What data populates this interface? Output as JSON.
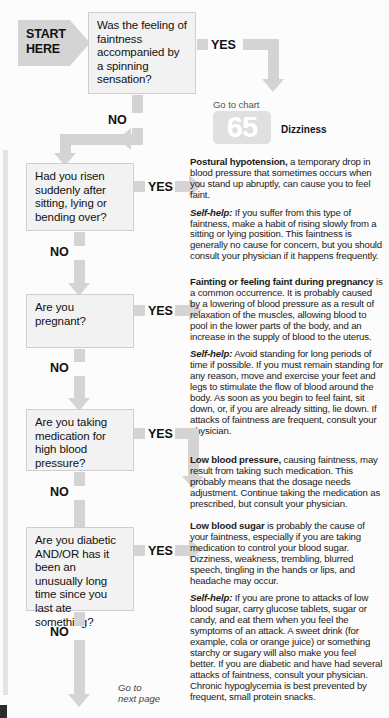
{
  "chart": {
    "start_label": "START\nHERE",
    "goto_chart_label": "Go to chart",
    "chart_number": "65",
    "chart_name": "Dizziness",
    "next_page_label": "Go to\nnext page",
    "yes_label": "YES",
    "no_label": "NO",
    "accent_box_fill": "#f2f2f2",
    "accent_arrow_fill": "#d4d4d4",
    "text_color": "#111111"
  },
  "questions": [
    {
      "id": "q1",
      "text": "Was the feeling of faintness accompanied by a spinning sensation?"
    },
    {
      "id": "q2",
      "text": "Had you risen suddenly after sitting, lying or bending over?"
    },
    {
      "id": "q3",
      "text": "Are you pregnant?"
    },
    {
      "id": "q4",
      "text": "Are you taking medication for high blood pressure?"
    },
    {
      "id": "q5",
      "text": "Are you diabetic AND/OR has it been an unusually long time since you last ate something?"
    }
  ],
  "answers": {
    "a2_title": "Postural hypotension,",
    "a2_body": " a temporary drop in blood pressure that sometimes occurs when you stand up abruptly, can cause you to feel faint.",
    "a2_selfhelp_label": "Self-help:",
    "a2_selfhelp_body": " If you suffer from this type of faintness, make a habit of rising slowly from a sitting or lying position. This faintness is generally no cause for concern, but you should consult your physician if it happens frequently.",
    "a3_title": "Fainting or feeling faint during pregnancy",
    "a3_body": " is a common occurrence. It is probably caused by a lowering of blood pressure as a result of relaxation of the muscles, allowing blood to pool in the lower parts of the body, and an increase in the supply of blood to the uterus.",
    "a3_selfhelp_label": "Self-help:",
    "a3_selfhelp_body": " Avoid standing for long periods of time if possible. If you must remain standing for any reason, move and exercise your feet and legs to stimulate the flow of blood around the body. As soon as you begin to feel faint, sit down, or, if you are already sitting, lie down. If attacks of faintness are frequent, consult your physician.",
    "a4_title": "Low blood pressure,",
    "a4_body": " causing faintness, may result from taking such medication. This probably means that the dosage needs adjustment. Continue taking the medication as prescribed, but consult your physician.",
    "a5_title": "Low blood sugar",
    "a5_body": " is probably the cause of your faintness, especially if you are taking medication to control your blood sugar. Dizziness, weakness, trembling, blurred speech, tingling in the hands or lips, and headache may occur.",
    "a5_selfhelp_label": "Self-help:",
    "a5_selfhelp_body": " If you are prone to attacks of low blood sugar, carry glucose tablets, sugar or candy, and eat them when you feel the symptoms of an attack. A sweet drink (for example, cola or orange juice) or something starchy or sugary will also make you feel better. If you are diabetic and have had several attacks of faintness, consult your physician. Chronic hypoglycemia is best prevented by frequent, small protein snacks."
  }
}
